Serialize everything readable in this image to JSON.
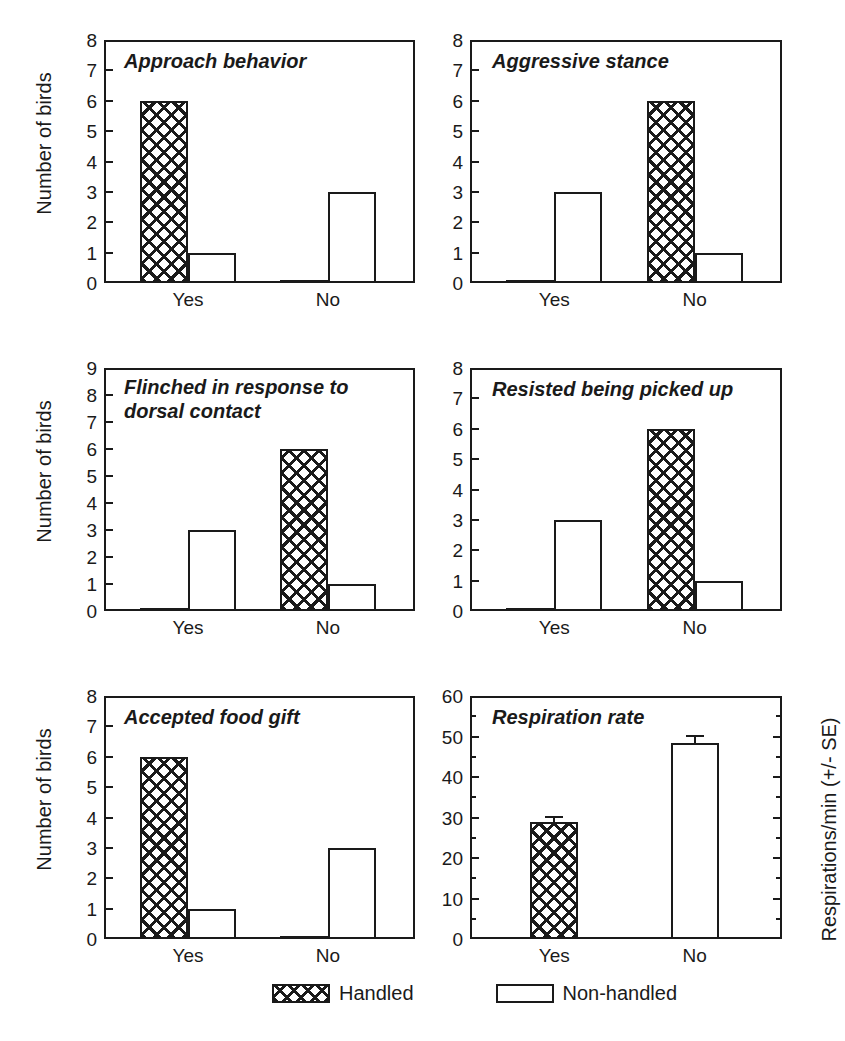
{
  "figure": {
    "ylabel_birds": "Number of birds",
    "ylabel_resp": "Respirations/min (+/- SE)",
    "categories": [
      "Yes",
      "No"
    ]
  },
  "legend": {
    "handled": "Handled",
    "non_handled": "Non-handled"
  },
  "chart_data": [
    {
      "id": "approach-behavior",
      "type": "bar",
      "title": "Approach behavior",
      "xlabel": "",
      "ylabel": "Number of birds",
      "categories": [
        "Yes",
        "No"
      ],
      "ylim": [
        0,
        8
      ],
      "yticks": [
        0,
        1,
        2,
        3,
        4,
        5,
        6,
        7,
        8
      ],
      "grid": false,
      "legend_position": "bottom",
      "series": [
        {
          "name": "Handled",
          "values": [
            6,
            0
          ]
        },
        {
          "name": "Non-handled",
          "values": [
            1,
            3
          ]
        }
      ]
    },
    {
      "id": "aggressive-stance",
      "type": "bar",
      "title": "Aggressive stance",
      "xlabel": "",
      "ylabel": "",
      "categories": [
        "Yes",
        "No"
      ],
      "ylim": [
        0,
        8
      ],
      "yticks": [
        0,
        1,
        2,
        3,
        4,
        5,
        6,
        7,
        8
      ],
      "grid": false,
      "legend_position": "bottom",
      "series": [
        {
          "name": "Handled",
          "values": [
            0,
            6
          ]
        },
        {
          "name": "Non-handled",
          "values": [
            3,
            1
          ]
        }
      ]
    },
    {
      "id": "flinched-dorsal-contact",
      "type": "bar",
      "title": "Flinched in response to\ndorsal contact",
      "xlabel": "",
      "ylabel": "Number of birds",
      "categories": [
        "Yes",
        "No"
      ],
      "ylim": [
        0,
        9
      ],
      "yticks": [
        0,
        1,
        2,
        3,
        4,
        5,
        6,
        7,
        8,
        9
      ],
      "grid": false,
      "legend_position": "bottom",
      "series": [
        {
          "name": "Handled",
          "values": [
            0,
            6
          ]
        },
        {
          "name": "Non-handled",
          "values": [
            3,
            1
          ]
        }
      ]
    },
    {
      "id": "resisted-being-picked-up",
      "type": "bar",
      "title": "Resisted being picked up",
      "xlabel": "",
      "ylabel": "",
      "categories": [
        "Yes",
        "No"
      ],
      "ylim": [
        0,
        8
      ],
      "yticks": [
        0,
        1,
        2,
        3,
        4,
        5,
        6,
        7,
        8
      ],
      "grid": false,
      "legend_position": "bottom",
      "series": [
        {
          "name": "Handled",
          "values": [
            0,
            6
          ]
        },
        {
          "name": "Non-handled",
          "values": [
            3,
            1
          ]
        }
      ]
    },
    {
      "id": "accepted-food-gift",
      "type": "bar",
      "title": "Accepted food gift",
      "xlabel": "",
      "ylabel": "Number of birds",
      "categories": [
        "Yes",
        "No"
      ],
      "ylim": [
        0,
        8
      ],
      "yticks": [
        0,
        1,
        2,
        3,
        4,
        5,
        6,
        7,
        8
      ],
      "grid": false,
      "legend_position": "bottom",
      "series": [
        {
          "name": "Handled",
          "values": [
            6,
            0
          ]
        },
        {
          "name": "Non-handled",
          "values": [
            1,
            3
          ]
        }
      ]
    },
    {
      "id": "respiration-rate",
      "type": "bar",
      "title": "Respiration rate",
      "xlabel": "",
      "ylabel": "Respirations/min (+/- SE)",
      "categories": [
        "Handled",
        "Non-handled"
      ],
      "ylim": [
        0,
        60
      ],
      "yticks": [
        0,
        10,
        20,
        30,
        40,
        50,
        60
      ],
      "minor_yticks": [
        5,
        15,
        25,
        35,
        45,
        55
      ],
      "grid": false,
      "legend_position": "bottom",
      "series": [
        {
          "name": "Handled",
          "values": [
            29
          ],
          "errors": [
            1
          ]
        },
        {
          "name": "Non-handled",
          "values": [
            48.5
          ],
          "errors": [
            1.5
          ]
        }
      ]
    }
  ],
  "panel_labels": {
    "p1_title": "Approach behavior",
    "p2_title": "Aggressive stance",
    "p3_title": "Flinched in response to\ndorsal contact",
    "p4_title": "Resisted being picked up",
    "p5_title": "Accepted food gift",
    "p6_title": "Respiration rate"
  },
  "ticks": {
    "p1": [
      "8",
      "7",
      "6",
      "5",
      "4",
      "3",
      "2",
      "1",
      "0"
    ],
    "p2": [
      "8",
      "7",
      "6",
      "5",
      "4",
      "3",
      "2",
      "1",
      "0"
    ],
    "p3": [
      "9",
      "8",
      "7",
      "6",
      "5",
      "4",
      "3",
      "2",
      "1",
      "0"
    ],
    "p4": [
      "8",
      "7",
      "6",
      "5",
      "4",
      "3",
      "2",
      "1",
      "0"
    ],
    "p5": [
      "8",
      "7",
      "6",
      "5",
      "4",
      "3",
      "2",
      "1",
      "0"
    ],
    "p6": [
      "60",
      "50",
      "40",
      "30",
      "20",
      "10",
      "0"
    ]
  },
  "xaxis": {
    "yes": "Yes",
    "no": "No"
  }
}
